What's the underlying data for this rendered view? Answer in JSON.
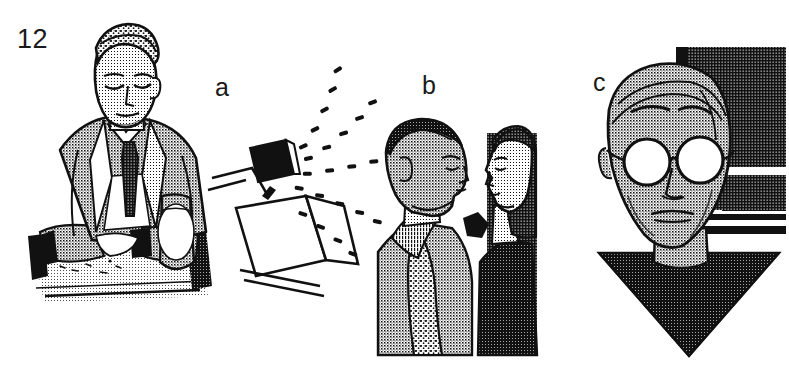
{
  "figure": {
    "number": "12",
    "style": "halftone line-art illustration, black ink on white paper",
    "width": 789,
    "height": 387,
    "background_color": "#ffffff",
    "ink_color": "#111111"
  },
  "panels": [
    {
      "id": "a",
      "label": "a",
      "label_position": {
        "x": 215,
        "y": 75
      },
      "description": "Seated man in suit and tie at a table, head lowered, beside a spray dispenser emitting a fan of droplets",
      "subjects": [
        {
          "name": "seated-man",
          "details": "man in halftone-shaded suit jacket, white shirt, dark tie, short combed hair, eyes cast down, forearms resting on table"
        },
        {
          "name": "spray-device",
          "details": "box-shaped dispenser on an angled stand with a dark nozzle head releasing a cone of dash-shaped droplets to the upper right"
        },
        {
          "name": "table",
          "details": "light table surface with scattered small objects and a pale cylindrical container"
        }
      ]
    },
    {
      "id": "b",
      "label": "b",
      "label_position": {
        "x": 422,
        "y": 73
      },
      "description": "Two people in profile facing each other at close range, a small black pentagon floats between their mouths",
      "subjects": [
        {
          "name": "man-profile-left",
          "details": "man facing right, short cropped hair, heavy halftone coat with textured lapel"
        },
        {
          "name": "woman-profile-right",
          "details": "woman facing left, dark bobbed hair, dark coat, shown against a dark halftone background panel"
        },
        {
          "name": "breath-marker",
          "details": "solid black pentagon symbol between the two faces"
        }
      ]
    },
    {
      "id": "c",
      "label": "c",
      "label_position": {
        "x": 593,
        "y": 70
      },
      "description": "Frontal portrait of a balding man wearing round spectacles, shoulders rendered as a dark downward triangle, dark halftone wall panels behind",
      "subjects": [
        {
          "name": "portrait-head",
          "details": "long oval face, receding hairline, arched brows, round wire-rim glasses with white lenses, narrow nose, thin lips"
        },
        {
          "name": "round-glasses",
          "details": "two circular white lenses joined by a bridge, dark rims"
        },
        {
          "name": "dark-triangle-garment",
          "details": "heavy black halftone triangle pointing down, reading as shoulders or a cape"
        },
        {
          "name": "background-panels",
          "details": "dark halftone rectangles with white horizontal gaps suggesting a window or wall behind the figure"
        }
      ]
    }
  ],
  "colors": {
    "paper": "#ffffff",
    "ink": "#111111",
    "halftone_light": "#d8d8d8",
    "halftone_mid": "#9a9a9a",
    "halftone_dark": "#3a3a3a"
  }
}
